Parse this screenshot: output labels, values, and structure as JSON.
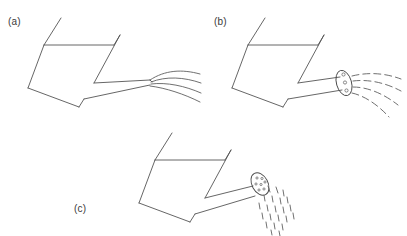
{
  "figure": {
    "kind": "line-drawing",
    "background_color": "#ffffff",
    "stroke_color": "#555555",
    "panel_count": 3
  },
  "panels": [
    {
      "id": "a",
      "label": "(a)",
      "label_position": {
        "x": 8,
        "y": 16
      },
      "description": "watering can with open spout emitting continuous curved water streams",
      "has_rose": false,
      "stream_style": "continuous",
      "stream_count": 4
    },
    {
      "id": "b",
      "label": "(b)",
      "label_position": {
        "x": 214,
        "y": 16
      },
      "description": "watering can fitted with a perforated rose emitting broken curved water streams",
      "has_rose": true,
      "rose_hole_count": 3,
      "stream_style": "dashed",
      "stream_count": 4
    },
    {
      "id": "c",
      "label": "(c)",
      "label_position": {
        "x": 74,
        "y": 203
      },
      "description": "watering can tilted with rose sprinkling droplets downward",
      "has_rose": true,
      "rose_hole_count": 7,
      "stream_style": "droplets",
      "droplet_count": 22
    }
  ],
  "colors": {
    "line": "#555555",
    "line_dark": "#4a4a4a",
    "stream": "#606060",
    "label_text": "#3a3a3a",
    "background": "#ffffff"
  }
}
